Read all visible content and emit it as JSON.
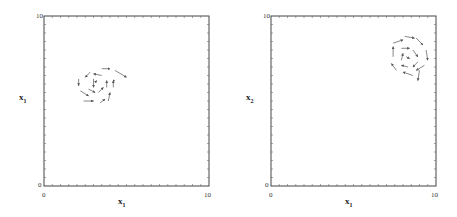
{
  "chart_data": [
    {
      "type": "vector-field",
      "title": "",
      "xlabel": "x1",
      "ylabel": "x1",
      "xlim": [
        0,
        10
      ],
      "ylim": [
        0,
        10
      ],
      "x_ticks_labeled": [
        "0",
        "10"
      ],
      "y_ticks_labeled": [
        "0",
        "10"
      ],
      "grid": false,
      "spiral_center": [
        3.1,
        6.1
      ],
      "rotation": "clockwise",
      "arrows": [
        {
          "x": 2.1,
          "y": 6.3,
          "dx": 0.0,
          "dy": -0.4
        },
        {
          "x": 2.2,
          "y": 5.6,
          "dx": 0.5,
          "dy": -0.3
        },
        {
          "x": 2.4,
          "y": 5.0,
          "dx": 0.6,
          "dy": 0.0
        },
        {
          "x": 3.4,
          "y": 4.9,
          "dx": 0.3,
          "dy": 0.2
        },
        {
          "x": 3.9,
          "y": 5.0,
          "dx": 0.1,
          "dy": 0.5
        },
        {
          "x": 4.2,
          "y": 5.8,
          "dx": -0.0,
          "dy": 0.4
        },
        {
          "x": 4.3,
          "y": 6.2,
          "dx": -0.0,
          "dy": 0.0
        },
        {
          "x": 3.5,
          "y": 6.5,
          "dx": -0.5,
          "dy": 0.1
        },
        {
          "x": 2.8,
          "y": 6.7,
          "dx": -0.3,
          "dy": -0.3
        },
        {
          "x": 3.5,
          "y": 6.9,
          "dx": 0.5,
          "dy": 0.0
        },
        {
          "x": 4.3,
          "y": 6.8,
          "dx": 0.7,
          "dy": -0.4
        },
        {
          "x": 3.0,
          "y": 6.3,
          "dx": -0.0,
          "dy": -0.5
        },
        {
          "x": 2.7,
          "y": 5.7,
          "dx": 0.4,
          "dy": -0.2
        },
        {
          "x": 3.3,
          "y": 5.5,
          "dx": 0.3,
          "dy": 0.3
        },
        {
          "x": 3.8,
          "y": 5.8,
          "dx": 0.0,
          "dy": 0.4
        },
        {
          "x": 3.1,
          "y": 6.1,
          "dx": 0.1,
          "dy": 0.1
        }
      ]
    },
    {
      "type": "vector-field",
      "title": "",
      "xlabel": "x1",
      "ylabel": "x2",
      "xlim": [
        0,
        10
      ],
      "ylim": [
        0,
        10
      ],
      "x_ticks_labeled": [
        "0",
        "10"
      ],
      "y_ticks_labeled": [
        "0",
        "10"
      ],
      "grid": false,
      "spiral_center": [
        8.2,
        7.5
      ],
      "rotation": "clockwise",
      "arrows": [
        {
          "x": 7.4,
          "y": 8.4,
          "dx": 0.6,
          "dy": 0.2
        },
        {
          "x": 8.1,
          "y": 8.8,
          "dx": 0.6,
          "dy": -0.1
        },
        {
          "x": 8.8,
          "y": 8.7,
          "dx": 0.4,
          "dy": -0.4
        },
        {
          "x": 9.4,
          "y": 8.0,
          "dx": 0.1,
          "dy": -0.6
        },
        {
          "x": 9.3,
          "y": 7.1,
          "dx": -0.5,
          "dy": -0.3
        },
        {
          "x": 8.6,
          "y": 6.5,
          "dx": -0.6,
          "dy": 0.2
        },
        {
          "x": 7.6,
          "y": 6.8,
          "dx": -0.3,
          "dy": 0.4
        },
        {
          "x": 7.4,
          "y": 7.6,
          "dx": 0.0,
          "dy": 0.6
        },
        {
          "x": 7.9,
          "y": 8.1,
          "dx": 0.5,
          "dy": 0.0
        },
        {
          "x": 8.6,
          "y": 8.0,
          "dx": 0.3,
          "dy": -0.4
        },
        {
          "x": 8.9,
          "y": 7.3,
          "dx": -0.3,
          "dy": -0.3
        },
        {
          "x": 8.3,
          "y": 7.0,
          "dx": -0.4,
          "dy": 0.1
        },
        {
          "x": 7.9,
          "y": 7.4,
          "dx": 0.1,
          "dy": 0.4
        },
        {
          "x": 8.2,
          "y": 7.6,
          "dx": 0.2,
          "dy": -0.1
        },
        {
          "x": 9.0,
          "y": 6.8,
          "dx": -0.1,
          "dy": -0.6
        }
      ]
    }
  ],
  "plots": [
    {
      "ylabel_main": "x",
      "ylabel_sub": "1",
      "xlabel_main": "x",
      "xlabel_sub": "1",
      "x0": "0",
      "x10": "10",
      "y0": "0",
      "y10": "10"
    },
    {
      "ylabel_main": "x",
      "ylabel_sub": "2",
      "xlabel_main": "x",
      "xlabel_sub": "1",
      "x0": "0",
      "x10": "10",
      "y0": "0",
      "y10": "10"
    }
  ]
}
